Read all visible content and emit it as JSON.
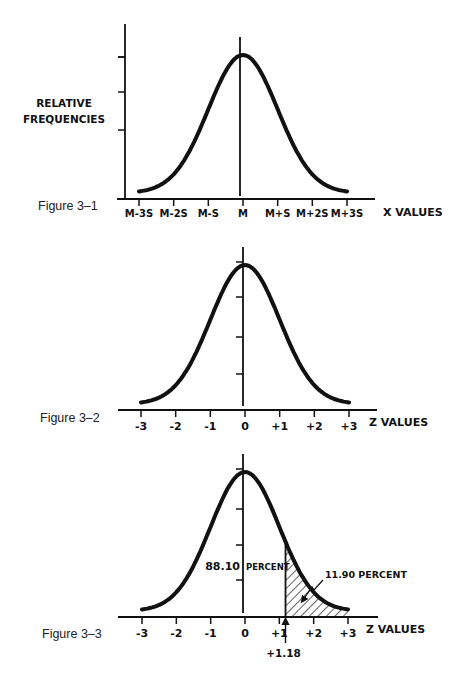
{
  "chart_data": [
    {
      "type": "line",
      "figure_label": "Figure 3–1",
      "title": "",
      "ylabel": [
        "RELATIVE",
        "FREQUENCIES"
      ],
      "xlabel": "X VALUES",
      "x_tick_labels": [
        "M-3S",
        "M-2S",
        "M-S",
        "M",
        "M+S",
        "M+2S",
        "M+3S"
      ],
      "x_ticks": [
        -3,
        -2,
        -1,
        0,
        1,
        2,
        3
      ],
      "xlim": [
        -3,
        3
      ],
      "y_tick_count": 5,
      "series": [
        {
          "name": "normal curve",
          "function": "normal",
          "mean": 0,
          "sd": 1
        }
      ],
      "grid": false,
      "center_line_at": 0
    },
    {
      "type": "line",
      "figure_label": "Figure 3–2",
      "title": "",
      "ylabel": "",
      "xlabel": "Z VALUES",
      "x_tick_labels": [
        "-3",
        "-2",
        "-1",
        "0",
        "+1",
        "+2",
        "+3"
      ],
      "x_ticks": [
        -3,
        -2,
        -1,
        0,
        1,
        2,
        3
      ],
      "xlim": [
        -3,
        3
      ],
      "y_tick_count": 4,
      "series": [
        {
          "name": "standard normal curve",
          "function": "normal",
          "mean": 0,
          "sd": 1
        }
      ],
      "grid": false,
      "y_axis_at": 0
    },
    {
      "type": "area",
      "figure_label": "Figure 3–3",
      "title": "",
      "ylabel": "",
      "xlabel": "Z VALUES",
      "x_tick_labels": [
        "-3",
        "-2",
        "-1",
        "0",
        "+1",
        "+2",
        "+3"
      ],
      "x_ticks": [
        -3,
        -2,
        -1,
        0,
        1,
        2,
        3
      ],
      "xlim": [
        -3,
        3
      ],
      "y_tick_count": 4,
      "series": [
        {
          "name": "standard normal curve",
          "function": "normal",
          "mean": 0,
          "sd": 1
        }
      ],
      "grid": false,
      "y_axis_at": 0,
      "cutoff_z": 1.18,
      "cutoff_label": "+1.18",
      "annotations": [
        {
          "region": "below_cutoff",
          "value_text": "88.10",
          "unit_text": "PERCENT",
          "percent": 88.1
        },
        {
          "region": "above_cutoff",
          "text": "11.90 PERCENT",
          "percent": 11.9,
          "shaded": true
        }
      ]
    }
  ]
}
